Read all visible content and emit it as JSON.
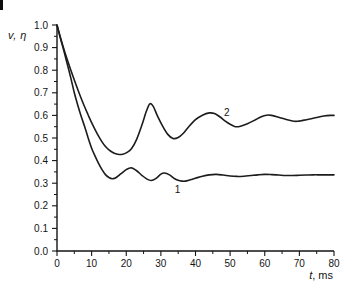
{
  "figure_labels": {
    "ylabel": "v, η",
    "xlabel_var": "t",
    "xlabel_unit": ", ms"
  },
  "chart_data": {
    "type": "line",
    "title": "",
    "xlabel": "t, ms",
    "ylabel": "v, η",
    "xlim": [
      0,
      80
    ],
    "ylim": [
      0.0,
      1.0
    ],
    "grid": false,
    "legend": "inline numeric labels on curves",
    "x_ticks": [
      "0",
      "10",
      "20",
      "30",
      "40",
      "50",
      "60",
      "70",
      "80"
    ],
    "x_minor_ticks": [
      5,
      15,
      25,
      35,
      45,
      55,
      65,
      75
    ],
    "y_ticks": [
      "1.0",
      "0.9",
      "0.8",
      "0.7",
      "0.6",
      "0.5",
      "0.4",
      "0.3",
      "0.2",
      "0.1",
      "0.0"
    ],
    "y_minor_ticks": [
      0.95,
      0.85,
      0.75,
      0.65,
      0.55,
      0.45,
      0.35,
      0.25,
      0.15,
      0.05
    ],
    "colors": {
      "axis": "#141414",
      "curve": "#1c1c1c"
    },
    "series": [
      {
        "name": "1",
        "label_at": [
          34.8,
          0.27
        ],
        "points": [
          [
            0,
            1.0
          ],
          [
            1,
            0.94
          ],
          [
            2,
            0.885
          ],
          [
            3,
            0.825
          ],
          [
            4,
            0.765
          ],
          [
            5,
            0.7
          ],
          [
            6,
            0.645
          ],
          [
            7,
            0.595
          ],
          [
            8,
            0.55
          ],
          [
            9,
            0.5
          ],
          [
            10,
            0.455
          ],
          [
            11,
            0.42
          ],
          [
            12,
            0.388
          ],
          [
            13,
            0.36
          ],
          [
            14,
            0.338
          ],
          [
            15,
            0.325
          ],
          [
            16,
            0.32
          ],
          [
            17,
            0.324
          ],
          [
            18.5,
            0.342
          ],
          [
            20,
            0.36
          ],
          [
            21.5,
            0.368
          ],
          [
            23,
            0.355
          ],
          [
            24.5,
            0.335
          ],
          [
            26,
            0.318
          ],
          [
            27.2,
            0.312
          ],
          [
            28.5,
            0.32
          ],
          [
            30,
            0.34
          ],
          [
            31,
            0.345
          ],
          [
            32.5,
            0.337
          ],
          [
            34,
            0.32
          ],
          [
            35.5,
            0.311
          ],
          [
            37,
            0.309
          ],
          [
            38.5,
            0.315
          ],
          [
            40,
            0.322
          ],
          [
            42,
            0.331
          ],
          [
            44,
            0.337
          ],
          [
            46,
            0.339
          ],
          [
            48,
            0.336
          ],
          [
            50,
            0.332
          ],
          [
            52,
            0.33
          ],
          [
            54,
            0.331
          ],
          [
            56,
            0.334
          ],
          [
            58,
            0.337
          ],
          [
            60,
            0.339
          ],
          [
            62,
            0.338
          ],
          [
            64,
            0.336
          ],
          [
            66,
            0.334
          ],
          [
            68,
            0.334
          ],
          [
            70,
            0.335
          ],
          [
            72,
            0.336
          ],
          [
            74,
            0.337
          ],
          [
            76,
            0.337
          ],
          [
            78,
            0.337
          ],
          [
            80,
            0.337
          ]
        ]
      },
      {
        "name": "2",
        "label_at": [
          49.0,
          0.615
        ],
        "points": [
          [
            0,
            1.0
          ],
          [
            1,
            0.945
          ],
          [
            2,
            0.893
          ],
          [
            3,
            0.845
          ],
          [
            4,
            0.8
          ],
          [
            5,
            0.757
          ],
          [
            6,
            0.715
          ],
          [
            7,
            0.675
          ],
          [
            8,
            0.637
          ],
          [
            9,
            0.602
          ],
          [
            10,
            0.568
          ],
          [
            11,
            0.537
          ],
          [
            12,
            0.508
          ],
          [
            13,
            0.483
          ],
          [
            14,
            0.462
          ],
          [
            15,
            0.447
          ],
          [
            16,
            0.437
          ],
          [
            17,
            0.43
          ],
          [
            18,
            0.427
          ],
          [
            19,
            0.428
          ],
          [
            20,
            0.434
          ],
          [
            21.5,
            0.452
          ],
          [
            23,
            0.494
          ],
          [
            24.5,
            0.556
          ],
          [
            25.8,
            0.618
          ],
          [
            26.8,
            0.651
          ],
          [
            27.8,
            0.64
          ],
          [
            29,
            0.598
          ],
          [
            30.5,
            0.553
          ],
          [
            32,
            0.516
          ],
          [
            33.5,
            0.498
          ],
          [
            35,
            0.502
          ],
          [
            36.5,
            0.521
          ],
          [
            38,
            0.549
          ],
          [
            40,
            0.581
          ],
          [
            42,
            0.601
          ],
          [
            44,
            0.611
          ],
          [
            45.5,
            0.608
          ],
          [
            47,
            0.594
          ],
          [
            48.5,
            0.576
          ],
          [
            50,
            0.561
          ],
          [
            51.5,
            0.55
          ],
          [
            53,
            0.552
          ],
          [
            55,
            0.563
          ],
          [
            57,
            0.578
          ],
          [
            59,
            0.594
          ],
          [
            60.5,
            0.601
          ],
          [
            62,
            0.6
          ],
          [
            64,
            0.592
          ],
          [
            66,
            0.583
          ],
          [
            68,
            0.575
          ],
          [
            69.5,
            0.574
          ],
          [
            71,
            0.578
          ],
          [
            73,
            0.584
          ],
          [
            75,
            0.591
          ],
          [
            77,
            0.597
          ],
          [
            79,
            0.6
          ],
          [
            80,
            0.6
          ]
        ]
      }
    ]
  }
}
